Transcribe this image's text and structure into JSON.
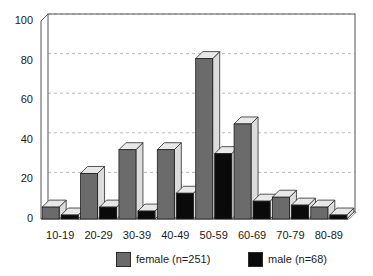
{
  "chart_data": {
    "type": "bar",
    "title": "",
    "subtitle": "",
    "xlabel": "",
    "ylabel": "",
    "categories": [
      "10-19",
      "20-29",
      "30-39",
      "40-49",
      "50-59",
      "60-69",
      "70-79",
      "80-89"
    ],
    "series": [
      {
        "name": "female (n=251)",
        "values": [
          6,
          23,
          35,
          35,
          81,
          48,
          11,
          6
        ],
        "color": "#6b6b6b"
      },
      {
        "name": "male (n=68)",
        "values": [
          2,
          6,
          4,
          13,
          33,
          9,
          7,
          2
        ],
        "color": "#0a0a0a"
      }
    ],
    "ylim": [
      0,
      100
    ],
    "yticks": [
      0,
      20,
      40,
      60,
      80,
      100
    ],
    "ytick_labels": [
      "0",
      "20",
      "40",
      "60",
      "80",
      "100"
    ],
    "grid": true,
    "grid_axis": "y",
    "grid_style": "dashed",
    "grid_color": "#b9b9c8",
    "legend_position": "bottom",
    "style": "3d-bars",
    "frame_color": "#555555",
    "background": "#ffffff"
  },
  "legend": {
    "entries": [
      {
        "label": "female (n=251)",
        "color": "#6b6b6b"
      },
      {
        "label": "male (n=68)",
        "color": "#0a0a0a"
      }
    ]
  }
}
